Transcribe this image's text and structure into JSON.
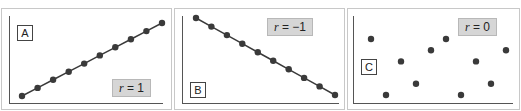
{
  "chart_data": [
    {
      "type": "scatter",
      "panel_label": "A",
      "annotation": "r = 1",
      "correlation": 1,
      "line": true,
      "points": [
        [
          1,
          1
        ],
        [
          2,
          2
        ],
        [
          3,
          3
        ],
        [
          4,
          4
        ],
        [
          5,
          5
        ],
        [
          6,
          6
        ],
        [
          7,
          7
        ],
        [
          8,
          8
        ],
        [
          9,
          9
        ],
        [
          10,
          10
        ]
      ],
      "title": "",
      "xlabel": "",
      "ylabel": "",
      "grid": false
    },
    {
      "type": "scatter",
      "panel_label": "B",
      "annotation": "r = −1",
      "correlation": -1,
      "line": true,
      "points": [
        [
          1,
          10
        ],
        [
          2,
          9
        ],
        [
          3,
          8
        ],
        [
          4,
          7
        ],
        [
          5,
          6
        ],
        [
          6,
          5
        ],
        [
          7,
          4
        ],
        [
          8,
          3
        ],
        [
          9,
          2
        ],
        [
          10,
          1
        ]
      ],
      "title": "",
      "xlabel": "",
      "ylabel": "",
      "grid": false
    },
    {
      "type": "scatter",
      "panel_label": "C",
      "annotation": "r = 0",
      "correlation": 0,
      "line": false,
      "points": [
        [
          1,
          6
        ],
        [
          2,
          1
        ],
        [
          3,
          4
        ],
        [
          4,
          2
        ],
        [
          5,
          5
        ],
        [
          6,
          6
        ],
        [
          7,
          1
        ],
        [
          8,
          4
        ],
        [
          9,
          2
        ],
        [
          10,
          5
        ]
      ],
      "title": "",
      "xlabel": "",
      "ylabel": "",
      "grid": false
    }
  ],
  "panels": {
    "a": {
      "letter": "A",
      "r_var": "r",
      "r_value": " = 1"
    },
    "b": {
      "letter": "B",
      "r_var": "r",
      "r_value": " =  −1"
    },
    "c": {
      "letter": "C",
      "r_var": "r",
      "r_value": " = 0"
    }
  },
  "colors": {
    "point": "#3a3a3a",
    "line": "#3a3a3a",
    "axis": "#555555",
    "frame": "#c8c8c8",
    "label_fill": "#d6d6d6"
  }
}
